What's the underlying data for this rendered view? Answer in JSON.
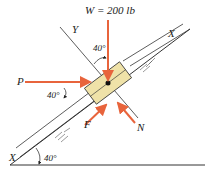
{
  "diagram": {
    "weight_label": "W = 200 lb",
    "axis_y": "Y",
    "axis_x_top": "X",
    "axis_x_bottom": "X",
    "force_p": "P",
    "force_f": "F",
    "force_n": "N",
    "angle_top": "40°",
    "angle_left": "40°",
    "angle_incline": "40°",
    "colors": {
      "force_arrow": "#e8643c",
      "block_fill": "#efe2a8",
      "line": "#333333"
    }
  }
}
